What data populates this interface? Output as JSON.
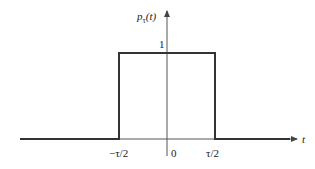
{
  "figure": {
    "function_label": "p",
    "function_subscript": "τ",
    "function_arg": "(t)",
    "x_axis_label": "t",
    "amplitude_label": "1",
    "ticks": {
      "left": "−τ/2",
      "origin": "0",
      "right": "τ/2"
    },
    "colors": {
      "line": "#333333",
      "axis": "#555555"
    }
  }
}
